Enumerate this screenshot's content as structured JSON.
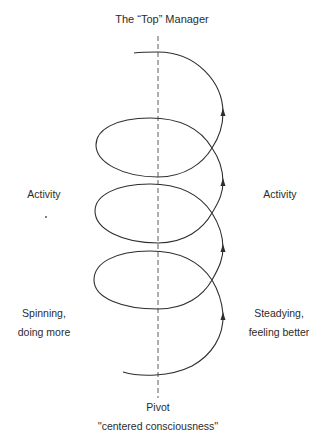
{
  "diagram": {
    "title": "The “Top” Manager",
    "left_labels": {
      "activity": "Activity",
      "state_line1": "Spinning,",
      "state_line2": "doing more"
    },
    "right_labels": {
      "activity": "Activity",
      "state_line1": "Steadying,",
      "state_line2": "feeling better"
    },
    "axis": {
      "label": "Pivot",
      "sublabel": "''centered consciousness''"
    },
    "spiral": {
      "loops": 3,
      "direction": "upward",
      "arrow_count": 4,
      "stroke_color": "#2e2e2e"
    }
  }
}
